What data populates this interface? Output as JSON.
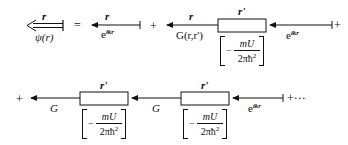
{
  "diagram": {
    "row1": {
      "term_lhs": {
        "top_label": "r",
        "bottom_label": "ψ(r)"
      },
      "equals": "=",
      "term1": {
        "top_label": "r",
        "bottom_label_base": "e",
        "bottom_label_exp": "ikr"
      },
      "plus1": "+",
      "term2": {
        "propagator_top": "r",
        "propagator_bottom": "G(r,r')",
        "vertex_top": "r'",
        "vertex_factor": {
          "minus": "−",
          "numerator": "mU",
          "denominator": "2πħ",
          "den_exp": "2"
        },
        "incoming_base": "e",
        "incoming_exp": "ikr"
      },
      "plus2": "+"
    },
    "row2": {
      "plus_lead": "+",
      "propagator1_label": "G",
      "vertex1_top": "r'",
      "vertex1_factor": {
        "minus": "−",
        "numerator": "mU",
        "denominator": "2πħ",
        "den_exp": "2"
      },
      "propagator2_label": "G",
      "vertex2_top": "r'",
      "vertex2_factor": {
        "minus": "−",
        "numerator": "mU",
        "denominator": "2πħ",
        "den_exp": "2"
      },
      "incoming_base": "e",
      "incoming_exp": "ikr",
      "trailing": "+···"
    },
    "colors": {
      "ink": "#111111",
      "background": "#ffffff"
    }
  }
}
